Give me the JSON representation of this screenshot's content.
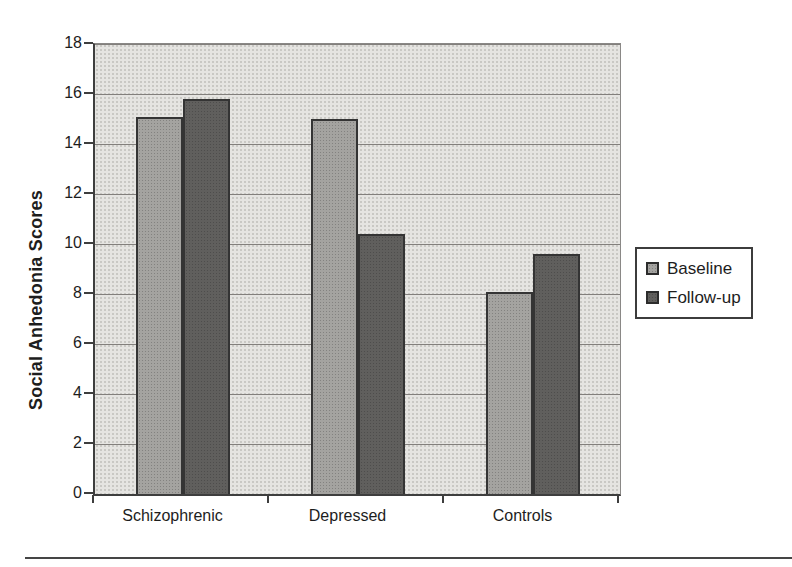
{
  "chart_data": {
    "type": "bar",
    "title": "",
    "ylabel": "Social Anhedonia Scores",
    "xlabel": "",
    "categories": [
      "Schizophrenic",
      "Depressed",
      "Controls"
    ],
    "series": [
      {
        "name": "Baseline",
        "color": "#a4a3a0",
        "values": [
          15.1,
          15.0,
          8.1
        ]
      },
      {
        "name": "Follow-up",
        "color": "#605f5d",
        "values": [
          15.8,
          10.4,
          9.6
        ]
      }
    ],
    "ylim": [
      0,
      18
    ],
    "yticks": [
      0,
      2,
      4,
      6,
      8,
      10,
      12,
      14,
      16,
      18
    ],
    "grid": true,
    "legend_position": "right",
    "plot_background": "#e5e4e1",
    "gridline_color": "#827f7c",
    "axis_color": "#3e3e3e"
  }
}
